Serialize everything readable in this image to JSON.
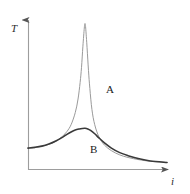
{
  "figure": {
    "background_color": "#ffffff",
    "width": 190,
    "height": 194
  },
  "axes": {
    "y_label": "T",
    "x_label": "i",
    "color": "#8a8a8a",
    "origin_px": [
      28,
      170
    ],
    "x_axis_end_px": [
      173,
      170
    ],
    "y_axis_top_px": [
      28,
      15
    ],
    "arrowheads": [
      "y-up",
      "x-right"
    ],
    "ticks": [],
    "gridlines": false
  },
  "curves": {
    "a": {
      "label": "A",
      "color": "#9a9a9a",
      "stroke_width": 1.0,
      "label_px": [
        106,
        84
      ]
    },
    "b": {
      "label": "B",
      "color": "#3a3a3a",
      "stroke_width": 1.6,
      "label_px": [
        90,
        144
      ]
    }
  },
  "chart_data": {
    "type": "line",
    "title": "",
    "subtitle": "",
    "xlabel": "i",
    "ylabel": "T",
    "xlim": [
      0,
      1
    ],
    "ylim": [
      0,
      1
    ],
    "grid": false,
    "legend": "inline-annotations",
    "annotations": [
      {
        "text": "A",
        "x": 0.54,
        "y": 0.56
      },
      {
        "text": "B",
        "x": 0.43,
        "y": 0.17
      }
    ],
    "series": [
      {
        "name": "A",
        "description": "Sharp narrow resonance peak (high-Q Lorentzian)",
        "peak_x": 0.41,
        "peak_y": 0.97,
        "baseline_left_y": 0.145,
        "baseline_right_y": 0.05,
        "x": [
          0.0,
          0.05,
          0.1,
          0.15,
          0.2,
          0.25,
          0.28,
          0.31,
          0.34,
          0.36,
          0.375,
          0.385,
          0.395,
          0.405,
          0.41,
          0.415,
          0.425,
          0.435,
          0.445,
          0.46,
          0.48,
          0.51,
          0.55,
          0.6,
          0.66,
          0.72,
          0.8,
          0.88,
          1.0
        ],
        "y": [
          0.145,
          0.15,
          0.158,
          0.17,
          0.19,
          0.225,
          0.255,
          0.3,
          0.38,
          0.47,
          0.58,
          0.68,
          0.82,
          0.94,
          0.97,
          0.94,
          0.81,
          0.66,
          0.54,
          0.4,
          0.3,
          0.22,
          0.165,
          0.128,
          0.1,
          0.083,
          0.068,
          0.058,
          0.05
        ]
      },
      {
        "name": "B",
        "description": "Broad low damped resonance peak (low-Q Lorentzian)",
        "peak_x": 0.41,
        "peak_y": 0.275,
        "baseline_left_y": 0.145,
        "baseline_right_y": 0.05,
        "x": [
          0.0,
          0.05,
          0.1,
          0.15,
          0.2,
          0.25,
          0.28,
          0.31,
          0.34,
          0.37,
          0.39,
          0.41,
          0.43,
          0.45,
          0.48,
          0.51,
          0.55,
          0.6,
          0.66,
          0.72,
          0.8,
          0.88,
          1.0
        ],
        "y": [
          0.145,
          0.15,
          0.158,
          0.172,
          0.192,
          0.218,
          0.236,
          0.252,
          0.265,
          0.272,
          0.275,
          0.276,
          0.272,
          0.262,
          0.24,
          0.213,
          0.18,
          0.145,
          0.115,
          0.095,
          0.074,
          0.06,
          0.05
        ]
      }
    ]
  }
}
